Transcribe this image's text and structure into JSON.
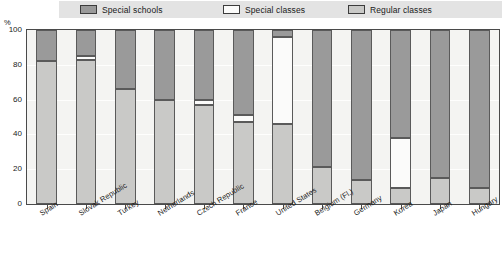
{
  "legend": {
    "items": [
      {
        "label": "Special schools",
        "color": "#9a9a9a"
      },
      {
        "label": "Special classes",
        "color": "#fbfbfa"
      },
      {
        "label": "Regular classes",
        "color": "#c9c9c7"
      }
    ]
  },
  "axes": {
    "y_unit": "%",
    "y_ticks": [
      "0",
      "20",
      "40",
      "60",
      "80",
      "100"
    ]
  },
  "chart_data": {
    "type": "bar",
    "title": "",
    "subtitle": "",
    "xlabel": "",
    "ylabel": "%",
    "ylim": [
      0,
      100
    ],
    "grid": true,
    "stacked": true,
    "stack_order_bottom_to_top": [
      "Regular classes",
      "Special classes",
      "Special schools"
    ],
    "legend_position": "top",
    "categories": [
      "Spain",
      "Slovak Republic",
      "Turkey",
      "Netherlands",
      "Czech Republic",
      "France",
      "United States",
      "Belgium (Fl.)",
      "Germany",
      "Korea",
      "Japan",
      "Hungary"
    ],
    "series": [
      {
        "name": "Regular classes",
        "color": "#c9c9c7",
        "values": [
          82,
          83,
          66,
          60,
          57,
          47,
          46,
          21,
          14,
          9,
          15,
          9
        ]
      },
      {
        "name": "Special classes",
        "color": "#fbfbfa",
        "values": [
          0,
          2,
          0,
          0,
          3,
          4,
          50,
          0,
          0,
          29,
          0,
          0
        ]
      },
      {
        "name": "Special schools",
        "color": "#9a9a9a",
        "values": [
          18,
          15,
          34,
          40,
          40,
          49,
          4,
          79,
          86,
          62,
          85,
          91
        ]
      }
    ]
  },
  "colors": {
    "legend_band": "#e3e3e3",
    "plot_background": "#f4f4f2",
    "axis": "#4a4a4a",
    "gridline": "#ffffff"
  }
}
